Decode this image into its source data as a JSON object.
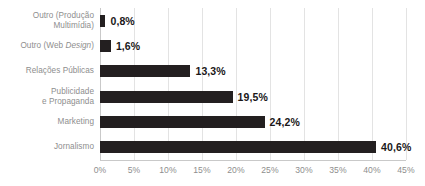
{
  "chart_data": {
    "type": "bar",
    "orientation": "horizontal",
    "title": "",
    "subtitle": "",
    "xlabel": "",
    "ylabel": "",
    "xlim": [
      0,
      45
    ],
    "xtick_step": 5,
    "grid": true,
    "legend": null,
    "value_suffix": "%",
    "decimal_separator": ",",
    "categories": [
      "Outro (Produção Multimídia)",
      "Outro (Web Design)",
      "Relações Públicas",
      "Publicidade e Propaganda",
      "Marketing",
      "Jornalismo"
    ],
    "values": [
      0.8,
      1.6,
      13.3,
      19.5,
      24.2,
      40.6
    ],
    "xticks": [
      0,
      5,
      10,
      15,
      20,
      25,
      30,
      35,
      40,
      45
    ],
    "xtick_labels": [
      "0%",
      "5%",
      "10%",
      "15%",
      "20%",
      "25%",
      "30%",
      "35%",
      "40%",
      "45%"
    ],
    "bars": [
      {
        "category_line1": "Outro (Produção",
        "category_line2": "Multimídia)",
        "category_italic": "",
        "value": 0.8,
        "value_label": "0,8%"
      },
      {
        "category_line1": "Outro (Web ",
        "category_line2": "",
        "category_italic": "Design",
        "category_line1_tail": ")",
        "value": 1.6,
        "value_label": "1,6%"
      },
      {
        "category_line1": "Relações Públicas",
        "category_line2": "",
        "category_italic": "",
        "value": 13.3,
        "value_label": "13,3%"
      },
      {
        "category_line1": "Publicidade",
        "category_line2": "e Propaganda",
        "category_italic": "",
        "value": 19.5,
        "value_label": "19,5%"
      },
      {
        "category_line1": "Marketing",
        "category_line2": "",
        "category_italic": "",
        "value": 24.2,
        "value_label": "24,2%"
      },
      {
        "category_line1": "Jornalismo",
        "category_line2": "",
        "category_italic": "",
        "value": 40.6,
        "value_label": "40,6%"
      }
    ]
  },
  "colors": {
    "bar": "#231f20",
    "value_label": "#1a1718",
    "category_label": "#8e8e8e",
    "tick_label": "#8e8e8e",
    "gridline": "#e3e3e3",
    "axis": "#c9c9c9",
    "background": "#ffffff"
  }
}
